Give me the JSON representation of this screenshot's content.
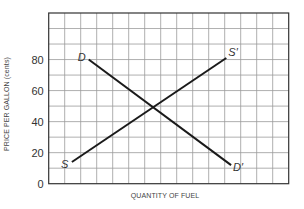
{
  "chart_data": {
    "type": "line",
    "title": "",
    "xlabel": "QUANTITY OF FUEL",
    "ylabel": "PRICE PER GALLON (cents)",
    "xlim": [
      0,
      15
    ],
    "ylim": [
      0,
      110
    ],
    "x_grid_divisions": 15,
    "y_grid_step": 10,
    "y_ticks": [
      0,
      20,
      40,
      60,
      80
    ],
    "x_ticks": [],
    "grid": true,
    "legend": "none",
    "series": [
      {
        "name": "Demand",
        "start_label": "D",
        "end_label": "D′",
        "points": [
          [
            2.5,
            80
          ],
          [
            11.4,
            12
          ]
        ]
      },
      {
        "name": "Supply",
        "start_label": "S",
        "end_label": "S′",
        "points": [
          [
            1.45,
            14
          ],
          [
            11.1,
            81
          ]
        ]
      }
    ],
    "annotations": [
      {
        "text": "equilibrium (intersection)",
        "x": 6,
        "y": 49
      }
    ]
  },
  "colors": {
    "grid": "#9a9a9a",
    "frame": "#333333",
    "line": "#1a1a1a",
    "text": "#333333"
  }
}
